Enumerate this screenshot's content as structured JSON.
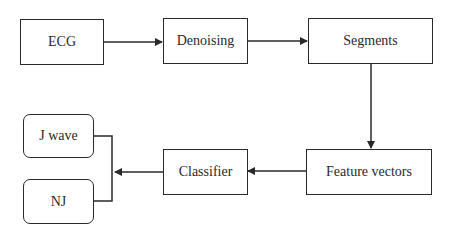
{
  "diagram": {
    "type": "flowchart",
    "nodes": [
      {
        "id": "ecg",
        "label": "ECG",
        "shape": "rect"
      },
      {
        "id": "denoising",
        "label": "Denoising",
        "shape": "rect"
      },
      {
        "id": "segments",
        "label": "Segments",
        "shape": "rect"
      },
      {
        "id": "feature_vectors",
        "label": "Feature vectors",
        "shape": "rect"
      },
      {
        "id": "classifier",
        "label": "Classifier",
        "shape": "rect"
      },
      {
        "id": "j_wave",
        "label": "J wave",
        "shape": "rounded-rect"
      },
      {
        "id": "nj",
        "label": "NJ",
        "shape": "rounded-rect"
      }
    ],
    "edges": [
      {
        "from": "ecg",
        "to": "denoising"
      },
      {
        "from": "denoising",
        "to": "segments"
      },
      {
        "from": "segments",
        "to": "feature_vectors"
      },
      {
        "from": "feature_vectors",
        "to": "classifier"
      },
      {
        "from": "classifier",
        "to": [
          "j_wave",
          "nj"
        ],
        "style": "bracket"
      }
    ],
    "colors": {
      "stroke": "#2a2a2a",
      "background": "#ffffff"
    }
  },
  "labels": {
    "ecg": "ECG",
    "denoising": "Denoising",
    "segments": "Segments",
    "feature_vectors": "Feature vectors",
    "classifier": "Classifier",
    "j_wave": "J wave",
    "nj": "NJ"
  }
}
